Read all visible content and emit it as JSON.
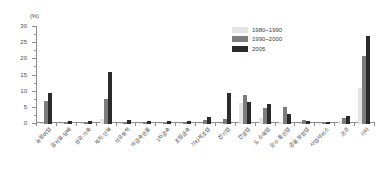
{
  "chart_data": {
    "type": "bar",
    "title": "",
    "subtitle": "",
    "xlabel": "",
    "ylabel": "",
    "unit_label": "(%)",
    "ylim": [
      0,
      30
    ],
    "yticks": [
      0,
      5,
      10,
      15,
      20,
      25,
      30
    ],
    "ytick_labels": [
      "0",
      "5",
      "10",
      "15",
      "20",
      "25",
      "30"
    ],
    "grid": false,
    "legend_position": "top-right",
    "categories": [
      "농림어업",
      "음식료·담배",
      "섬유·가죽",
      "제지·인쇄",
      "석유화학",
      "비금속광물",
      "1차금속",
      "조립금속",
      "기타제조업",
      "전기업",
      "건설업",
      "도·소매업",
      "운수·통신업",
      "금융·보험업",
      "사업서비스",
      "공공",
      "기타"
    ],
    "series": [
      {
        "name": "1980~1990",
        "color": "#e4e4e4",
        "values": [
          0.4,
          0.3,
          0.3,
          1.6,
          0.2,
          0.2,
          0.2,
          0.2,
          0.2,
          0.3,
          6.6,
          1.9,
          0.5,
          0.4,
          0.3,
          0.9,
          11.0
        ]
      },
      {
        "name": "1990~2000",
        "color": "#7d7d7d",
        "values": [
          7.0,
          0.5,
          0.6,
          7.7,
          0.7,
          0.5,
          0.3,
          0.5,
          1.1,
          1.4,
          8.9,
          5.0,
          5.2,
          1.2,
          0.4,
          2.0,
          21.0
        ]
      },
      {
        "name": "2005",
        "color": "#2b2b2b",
        "values": [
          9.5,
          0.8,
          1.0,
          16.1,
          1.2,
          0.8,
          0.9,
          0.9,
          2.2,
          9.5,
          6.8,
          6.3,
          3.2,
          1.0,
          0.6,
          2.4,
          27.2
        ]
      }
    ]
  }
}
